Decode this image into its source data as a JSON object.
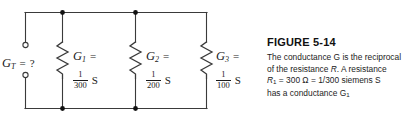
{
  "figure": {
    "title": "FIGURE 5-14",
    "caption_lines": [
      "The conductance G is the reciprocal",
      "of the resistance R.   A resistance",
      "R₁ = 300 Ω = 1/300 siemens S",
      "has a conductance G₁"
    ],
    "caption_parts": {
      "line1": "The conductance G is the reciprocal",
      "line2_a": "of the resistance ",
      "line2_r": "R",
      "line2_b": ".   A resistance",
      "line3_r": "R",
      "line3_sub": "1",
      "line3_rest": " = 300 Ω = 1/300 siemens S",
      "line4_a": "has a conductance G",
      "line4_sub": "1"
    }
  },
  "circuit": {
    "type": "parallel-conductance-network",
    "terminal_label": {
      "symbol": "G",
      "subscript": "T",
      "equals": "=",
      "value": "?"
    },
    "branches": [
      {
        "symbol": "G",
        "subscript": "1",
        "equals": "=",
        "numerator": "1",
        "denominator": "300",
        "unit": "S"
      },
      {
        "symbol": "G",
        "subscript": "2",
        "equals": "=",
        "numerator": "1",
        "denominator": "200",
        "unit": "S"
      },
      {
        "symbol": "G",
        "subscript": "3",
        "equals": "=",
        "numerator": "1",
        "denominator": "100",
        "unit": "S"
      }
    ],
    "colors": {
      "wire": "#3a3a3a",
      "node": "#111111",
      "text": "#1a1a1a",
      "background": "#ffffff"
    }
  }
}
